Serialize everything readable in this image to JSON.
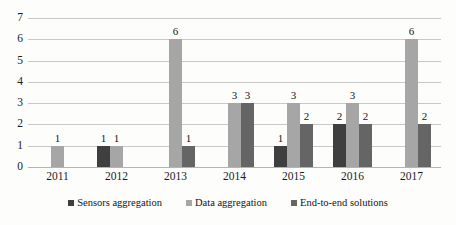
{
  "chart_data": {
    "type": "bar",
    "title": "",
    "subtitle": "",
    "xlabel": "",
    "ylabel": "",
    "categories": [
      "2011",
      "2012",
      "2013",
      "2014",
      "2015",
      "2016",
      "2017"
    ],
    "series": [
      {
        "name": "Sensors aggregation",
        "color": "#3f3f3f",
        "values": [
          null,
          1,
          null,
          null,
          1,
          2,
          null
        ]
      },
      {
        "name": "Data aggregation",
        "color": "#a6a6a6",
        "values": [
          1,
          1,
          6,
          3,
          3,
          3,
          6
        ]
      },
      {
        "name": "End-to-end solutions",
        "color": "#656565",
        "values": [
          null,
          null,
          1,
          3,
          2,
          2,
          2
        ]
      }
    ],
    "ylim": [
      0,
      7
    ],
    "yticks": [
      "0",
      "1",
      "2",
      "3",
      "4",
      "5",
      "6",
      "7"
    ],
    "grid": "horizontal",
    "legend_position": "bottom",
    "data_labels": true
  },
  "legend": {
    "items": [
      {
        "label": "Sensors aggregation"
      },
      {
        "label": "Data aggregation"
      },
      {
        "label": "End-to-end solutions"
      }
    ]
  }
}
